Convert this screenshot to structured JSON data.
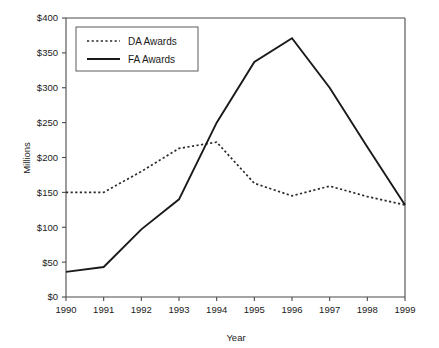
{
  "chart_data": {
    "type": "line",
    "title": "",
    "xlabel": "Year",
    "ylabel": "Millions",
    "categories": [
      1990,
      1991,
      1992,
      1993,
      1994,
      1995,
      1996,
      1997,
      1998,
      1999
    ],
    "x_tick_labels": [
      "1990",
      "1991",
      "1992",
      "1993",
      "1994",
      "1995",
      "1996",
      "1997",
      "1998",
      "1999"
    ],
    "y_tick_labels": [
      "$0",
      "$50",
      "$100",
      "$150",
      "$200",
      "$250",
      "$300",
      "$350",
      "$400"
    ],
    "y_tick_values": [
      0,
      50,
      100,
      150,
      200,
      250,
      300,
      350,
      400
    ],
    "ylim": [
      0,
      400
    ],
    "xlim": [
      1990,
      1999
    ],
    "grid": false,
    "legend_position": "top-left",
    "value_unit": "Millions of dollars",
    "series": [
      {
        "name": "DA Awards",
        "style": "dotted",
        "color": "#2a2a2a",
        "values": [
          150,
          150,
          180,
          213,
          222,
          163,
          145,
          159,
          144,
          132
        ]
      },
      {
        "name": "FA Awards",
        "style": "solid",
        "color": "#1a1a1a",
        "values": [
          36,
          43,
          97,
          140,
          250,
          337,
          371,
          300,
          215,
          132
        ]
      }
    ]
  },
  "legend": {
    "entries": [
      {
        "label": "DA Awards"
      },
      {
        "label": "FA Awards"
      }
    ]
  },
  "axes": {
    "y_axis_title": "Millions",
    "x_axis_title": "Year"
  }
}
